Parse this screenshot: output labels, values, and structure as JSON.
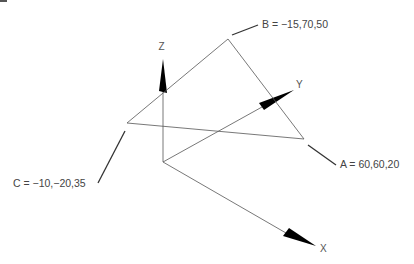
{
  "diagram": {
    "type": "3d-coordinate-triangle",
    "axes": {
      "x": {
        "label": "X"
      },
      "y": {
        "label": "Y"
      },
      "z": {
        "label": "Z"
      }
    },
    "points": [
      {
        "name": "A",
        "label": "A = 60,60,20",
        "coords": [
          60,
          60,
          20
        ]
      },
      {
        "name": "B",
        "label": "B = −15,70,50",
        "coords": [
          -15,
          70,
          50
        ]
      },
      {
        "name": "C",
        "label": "C = −10,−20,35",
        "coords": [
          -10,
          -20,
          35
        ]
      }
    ],
    "colors": {
      "line": "#555555",
      "arrow": "#000000",
      "text": "#444444",
      "background": "#ffffff"
    }
  }
}
